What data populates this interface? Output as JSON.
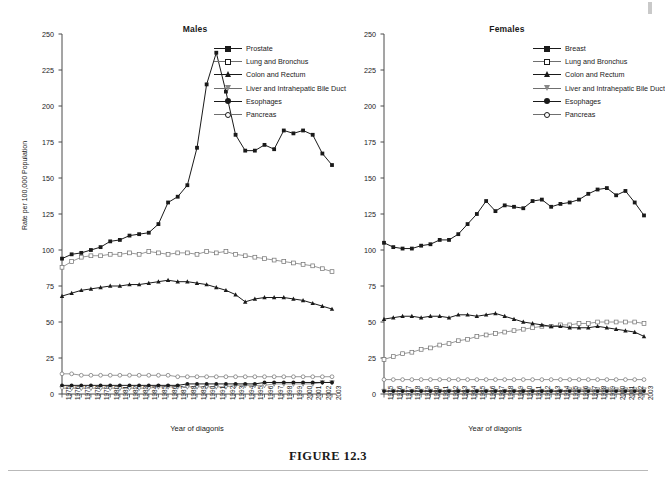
{
  "figure": {
    "caption": "FIGURE 12.3"
  },
  "chart_data": [
    {
      "type": "line",
      "title": "Males",
      "xlabel": "Year of diagonis",
      "ylabel": "Rate per 100,000 Population",
      "ylim": [
        0,
        250
      ],
      "yticks": [
        0,
        25,
        50,
        75,
        100,
        125,
        150,
        175,
        200,
        225,
        250
      ],
      "grid": false,
      "legend_position": "top-right",
      "categories": [
        1975,
        1976,
        1977,
        1978,
        1979,
        1980,
        1981,
        1982,
        1983,
        1984,
        1985,
        1986,
        1987,
        1988,
        1989,
        1990,
        1991,
        1992,
        1993,
        1994,
        1995,
        1996,
        1997,
        1998,
        1999,
        2000,
        2001,
        2002,
        2003
      ],
      "series": [
        {
          "name": "Prostate",
          "marker": "square-filled",
          "values": [
            94,
            97,
            98,
            100,
            102,
            106,
            107,
            110,
            111,
            112,
            118,
            133,
            137,
            145,
            171,
            215,
            237,
            210,
            180,
            169,
            169,
            173,
            170,
            183,
            181,
            183,
            180,
            167,
            159
          ]
        },
        {
          "name": "Lung and Bronchus",
          "marker": "square-open",
          "values": [
            88,
            92,
            95,
            96,
            96,
            97,
            97,
            98,
            97,
            99,
            98,
            97,
            98,
            98,
            97,
            99,
            98,
            99,
            97,
            96,
            95,
            94,
            93,
            92,
            91,
            90,
            89,
            87,
            85,
            84,
            82,
            80,
            75
          ]
        },
        {
          "name": "Colon and Rectum",
          "marker": "triangle-filled",
          "values": [
            68,
            70,
            72,
            73,
            74,
            75,
            75,
            76,
            76,
            77,
            78,
            79,
            78,
            78,
            77,
            76,
            74,
            72,
            69,
            64,
            66,
            67,
            67,
            67,
            66,
            65,
            63,
            61,
            59,
            57
          ]
        },
        {
          "name": "Liver and Intrahepatic Bile Duct",
          "marker": "triangle-open",
          "values": [
            4,
            4,
            4,
            4,
            4,
            4,
            4,
            4,
            4,
            4,
            5,
            5,
            5,
            5,
            5,
            5,
            5,
            5,
            6,
            6,
            6,
            6,
            7,
            7,
            7,
            7,
            7,
            8,
            8
          ]
        },
        {
          "name": "Esophages",
          "marker": "circle-filled",
          "values": [
            6,
            6,
            6,
            6,
            6,
            6,
            6,
            6,
            6,
            6,
            6,
            6,
            6,
            7,
            7,
            7,
            7,
            7,
            7,
            7,
            7,
            8,
            8,
            8,
            8,
            8,
            8,
            8,
            8
          ]
        },
        {
          "name": "Pancreas",
          "marker": "circle-open",
          "values": [
            14,
            14,
            13,
            13,
            13,
            13,
            13,
            13,
            13,
            13,
            13,
            13,
            12,
            12,
            12,
            12,
            12,
            12,
            12,
            12,
            12,
            12,
            12,
            12,
            12,
            12,
            12,
            12,
            12
          ]
        }
      ]
    },
    {
      "type": "line",
      "title": "Females",
      "xlabel": "Year of diagonis",
      "ylabel": "Rate per 100,000 Population",
      "ylim": [
        0,
        250
      ],
      "yticks": [
        0,
        25,
        50,
        75,
        100,
        125,
        150,
        175,
        200,
        225,
        250
      ],
      "grid": false,
      "legend_position": "top-right",
      "categories": [
        1975,
        1976,
        1977,
        1978,
        1979,
        1980,
        1981,
        1982,
        1983,
        1984,
        1985,
        1986,
        1987,
        1988,
        1989,
        1990,
        1991,
        1992,
        1993,
        1994,
        1995,
        1996,
        1997,
        1998,
        1999,
        2000,
        2001,
        2002,
        2003
      ],
      "series": [
        {
          "name": "Breast",
          "marker": "square-filled",
          "values": [
            105,
            102,
            101,
            101,
            103,
            104,
            107,
            107,
            111,
            118,
            125,
            134,
            127,
            131,
            130,
            129,
            134,
            135,
            130,
            132,
            133,
            135,
            139,
            142,
            143,
            138,
            141,
            133,
            124
          ]
        },
        {
          "name": "Lung and Bronchus",
          "marker": "square-open",
          "values": [
            24,
            26,
            28,
            29,
            31,
            32,
            34,
            35,
            37,
            38,
            40,
            41,
            42,
            43,
            44,
            45,
            46,
            47,
            47,
            48,
            48,
            49,
            49,
            50,
            50,
            50,
            50,
            50,
            49
          ]
        },
        {
          "name": "Colon and Rectum",
          "marker": "triangle-filled",
          "values": [
            52,
            53,
            54,
            54,
            53,
            54,
            54,
            53,
            55,
            55,
            54,
            55,
            56,
            54,
            52,
            50,
            49,
            48,
            47,
            47,
            46,
            46,
            46,
            47,
            46,
            45,
            44,
            43,
            40
          ]
        },
        {
          "name": "Liver and Intrahepatic Bile Duct",
          "marker": "triangle-open",
          "values": [
            2,
            2,
            2,
            2,
            2,
            2,
            2,
            2,
            2,
            2,
            2,
            2,
            2,
            2,
            2,
            2,
            2,
            2,
            2,
            2,
            3,
            3,
            3,
            3,
            3,
            3,
            3,
            3,
            3
          ]
        },
        {
          "name": "Esophages",
          "marker": "circle-filled",
          "values": [
            2,
            2,
            2,
            2,
            2,
            2,
            2,
            2,
            2,
            2,
            2,
            2,
            2,
            2,
            2,
            2,
            2,
            2,
            2,
            2,
            2,
            2,
            2,
            2,
            2,
            2,
            2,
            2,
            2
          ]
        },
        {
          "name": "Pancreas",
          "marker": "circle-open",
          "values": [
            10,
            10,
            10,
            10,
            10,
            10,
            10,
            10,
            10,
            10,
            10,
            10,
            10,
            10,
            10,
            10,
            10,
            10,
            10,
            10,
            10,
            10,
            10,
            10,
            10,
            10,
            10,
            10,
            10
          ]
        }
      ]
    }
  ]
}
